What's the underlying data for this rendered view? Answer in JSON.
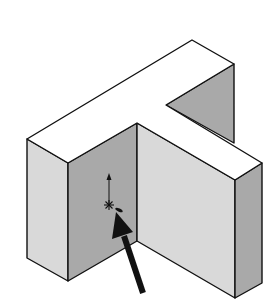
{
  "figure": {
    "colors": {
      "background": "#ffffff",
      "top_face": "#ffffff",
      "light_face": "#d9d9d9",
      "dark_face": "#a9a9a9",
      "edge": "#111111",
      "arrow": "#111111"
    },
    "faces": {
      "top": "27,139 192,40 234,64 166,105 262,163 235,180 137,123 68,163",
      "left_block_left": "27,139 68,163 68,281 27,258",
      "left_block_front": "68,163 137,123 137,241 68,281",
      "right_wing_front": "137,123 235,180 235,298 137,241",
      "right_block_right": "235,180 262,163 262,283 235,298",
      "notch_back": "166,105 234,64 234,143"
    },
    "sketch_point": {
      "x": 109,
      "y": 205,
      "axis_top_y": 176
    },
    "pointer_arrow": {
      "tail_x": 143,
      "tail_y": 293,
      "head_x": 116,
      "head_y": 212
    }
  }
}
